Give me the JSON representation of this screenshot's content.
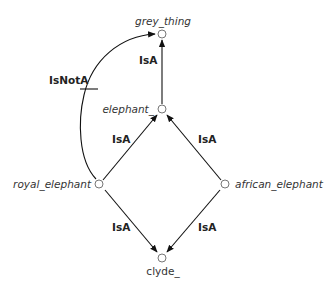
{
  "diagram": {
    "type": "inheritance-network",
    "nodes": [
      {
        "id": "grey_thing",
        "label": "grey_thing",
        "x": 162,
        "y": 34,
        "italic": true
      },
      {
        "id": "elephant_",
        "label": "elephant_",
        "x": 162,
        "y": 109,
        "italic": true
      },
      {
        "id": "royal_elephant",
        "label": "royal_elephant",
        "x": 99,
        "y": 184,
        "italic": true
      },
      {
        "id": "african_elephant",
        "label": "african_elephant",
        "x": 225,
        "y": 184,
        "italic": true
      },
      {
        "id": "clyde_",
        "label": "clyde_",
        "x": 162,
        "y": 258,
        "italic": false
      }
    ],
    "edges": [
      {
        "from": "elephant_",
        "to": "grey_thing",
        "label": "IsA"
      },
      {
        "from": "royal_elephant",
        "to": "elephant_",
        "label": "IsA"
      },
      {
        "from": "african_elephant",
        "to": "elephant_",
        "label": "IsA"
      },
      {
        "from": "clyde_",
        "to": "royal_elephant",
        "label": "IsA",
        "arrow_at": "clyde_"
      },
      {
        "from": "clyde_",
        "to": "african_elephant",
        "label": "IsA",
        "arrow_at": "clyde_"
      },
      {
        "from": "royal_elephant",
        "to": "grey_thing",
        "label": "IsNotA",
        "negated": true
      }
    ],
    "labels": {
      "grey_thing": "grey_thing",
      "elephant": "elephant_",
      "royal_elephant": "royal_elephant",
      "african_elephant": "african_elephant",
      "clyde": "clyde_",
      "isa_top": "IsA",
      "isa_mid_left": "IsA",
      "isa_mid_right": "IsA",
      "isa_bottom_left": "IsA",
      "isa_bottom_right": "IsA",
      "isnota": "IsNotA"
    }
  }
}
